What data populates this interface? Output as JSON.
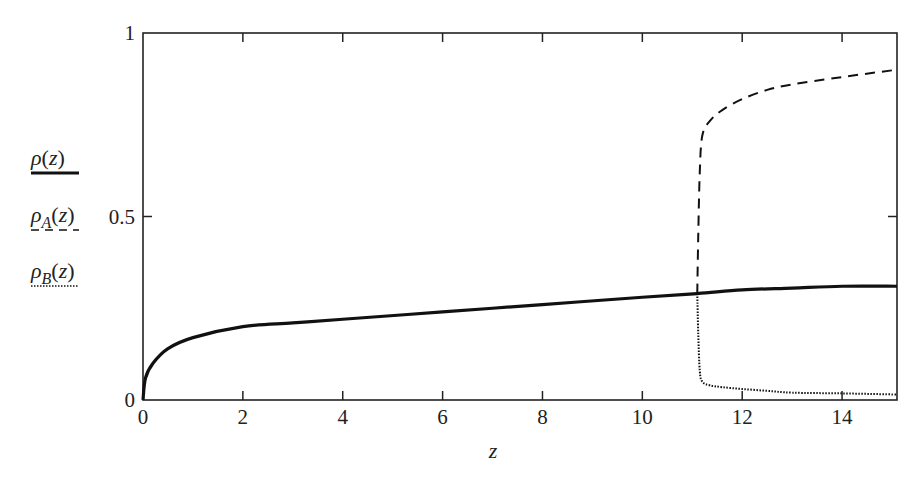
{
  "chart_data": {
    "type": "line",
    "title": "",
    "xlabel": "z",
    "ylabel": "",
    "xlim": [
      0,
      15.1
    ],
    "ylim": [
      0,
      1
    ],
    "grid": false,
    "legend_position": "left-outside",
    "x_ticks": [
      "0",
      "2",
      "4",
      "6",
      "8",
      "10",
      "12",
      "14"
    ],
    "y_ticks": [
      "0",
      "0.5",
      "1"
    ],
    "series": [
      {
        "name": "ρ(z)",
        "style": "solid",
        "x": [
          0,
          0.05,
          0.2,
          0.5,
          1,
          2,
          3,
          4,
          6,
          8,
          10,
          11.1,
          12,
          13,
          14,
          15.1
        ],
        "y": [
          0,
          0.06,
          0.1,
          0.14,
          0.17,
          0.2,
          0.21,
          0.22,
          0.24,
          0.26,
          0.28,
          0.29,
          0.3,
          0.305,
          0.31,
          0.31
        ]
      },
      {
        "name": "ρ_A(z)",
        "style": "dashed",
        "x": [
          11.1,
          11.12,
          11.15,
          11.2,
          11.35,
          11.6,
          12,
          12.5,
          13,
          14,
          15.1
        ],
        "y": [
          0.29,
          0.45,
          0.62,
          0.72,
          0.76,
          0.79,
          0.82,
          0.845,
          0.86,
          0.88,
          0.9
        ]
      },
      {
        "name": "ρ_B(z)",
        "style": "dotted",
        "x": [
          11.1,
          11.12,
          11.15,
          11.2,
          11.35,
          11.6,
          12,
          12.5,
          13,
          14,
          15.1
        ],
        "y": [
          0.29,
          0.18,
          0.08,
          0.05,
          0.04,
          0.035,
          0.03,
          0.025,
          0.02,
          0.018,
          0.015
        ]
      }
    ]
  },
  "legend": [
    {
      "base": "ρ",
      "sub": "",
      "arg": "(z)",
      "style": "solid"
    },
    {
      "base": "ρ",
      "sub": "A",
      "arg": "(z)",
      "style": "dashed"
    },
    {
      "base": "ρ",
      "sub": "B",
      "arg": "(z)",
      "style": "dotted"
    }
  ],
  "axes": {
    "x_label": "z",
    "x_tick_labels": [
      "0",
      "2",
      "4",
      "6",
      "8",
      "10",
      "12",
      "14"
    ],
    "y_tick_labels": [
      "0",
      "0.5",
      "1"
    ]
  },
  "colors": {
    "line": "#111111",
    "frame": "#222222",
    "background": "#ffffff"
  }
}
